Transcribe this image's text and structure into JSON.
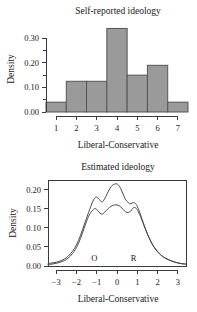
{
  "figure": {
    "width": 197,
    "height": 312,
    "background": "#ffffff",
    "foreground": "#1a1a1a"
  },
  "chart_data": [
    {
      "id": "self-reported-ideology",
      "type": "bar",
      "title": "Self-reported ideology",
      "xlabel": "Liberal-Conservative",
      "ylabel": "Density",
      "categories": [
        "1",
        "2",
        "3",
        "4",
        "5",
        "6",
        "7"
      ],
      "values": [
        0.04,
        0.125,
        0.125,
        0.34,
        0.15,
        0.19,
        0.04
      ],
      "xlim": [
        0.5,
        7.5
      ],
      "ylim": [
        0.0,
        0.35
      ],
      "xticks": [
        1,
        2,
        3,
        4,
        5,
        6,
        7
      ],
      "xtick_labels": [
        "1",
        "2",
        "3",
        "4",
        "5",
        "6",
        "7"
      ],
      "yticks": [
        0.0,
        0.1,
        0.2,
        0.3
      ],
      "ytick_labels": [
        "0.00",
        "0.10",
        "0.20",
        "0.30"
      ],
      "yminor_ticks": [
        0.05,
        0.15,
        0.25
      ],
      "grid": false,
      "legend": false,
      "bar_fill": "#9a9a9a",
      "bar_stroke": "#555555",
      "frame": "l-shaped-axes"
    },
    {
      "id": "estimated-ideology",
      "type": "line",
      "title": "Estimated ideology",
      "xlabel": "Liberal-Conservative",
      "ylabel": "Density",
      "xlim": [
        -3.4,
        3.4
      ],
      "ylim": [
        0.0,
        0.225
      ],
      "xticks": [
        -3,
        -2,
        -1,
        0,
        1,
        2,
        3
      ],
      "xtick_labels": [
        "−3",
        "−2",
        "−1",
        "0",
        "1",
        "2",
        "3"
      ],
      "yticks": [
        0.0,
        0.05,
        0.1,
        0.15,
        0.2
      ],
      "ytick_labels": [
        "0.00",
        "0.05",
        "0.10",
        "0.15",
        "0.20"
      ],
      "grid": false,
      "legend": false,
      "frame": "box",
      "curve_stroke": "#4a4a4a",
      "annotations": [
        {
          "label": "O",
          "x": -1.12,
          "y": 0.012
        },
        {
          "label": "R",
          "x": 0.82,
          "y": 0.012
        }
      ],
      "x": [
        -3.4,
        -3.2,
        -3.0,
        -2.8,
        -2.6,
        -2.4,
        -2.2,
        -2.0,
        -1.8,
        -1.6,
        -1.4,
        -1.2,
        -1.05,
        -0.9,
        -0.78,
        -0.68,
        -0.55,
        -0.42,
        -0.3,
        -0.18,
        -0.05,
        0.05,
        0.18,
        0.3,
        0.42,
        0.55,
        0.68,
        0.8,
        0.92,
        1.05,
        1.2,
        1.4,
        1.6,
        1.8,
        2.0,
        2.2,
        2.4,
        2.6,
        2.8,
        3.0,
        3.2,
        3.4
      ],
      "series": [
        {
          "name": "upper",
          "values": [
            0.006,
            0.008,
            0.01,
            0.013,
            0.018,
            0.026,
            0.038,
            0.055,
            0.08,
            0.11,
            0.14,
            0.168,
            0.18,
            0.176,
            0.168,
            0.17,
            0.182,
            0.196,
            0.207,
            0.213,
            0.215,
            0.213,
            0.203,
            0.188,
            0.174,
            0.166,
            0.163,
            0.166,
            0.163,
            0.15,
            0.128,
            0.098,
            0.072,
            0.052,
            0.038,
            0.027,
            0.02,
            0.015,
            0.011,
            0.008,
            0.006,
            0.005
          ]
        },
        {
          "name": "lower",
          "values": [
            0.004,
            0.005,
            0.007,
            0.01,
            0.014,
            0.021,
            0.032,
            0.048,
            0.072,
            0.102,
            0.13,
            0.146,
            0.15,
            0.142,
            0.136,
            0.137,
            0.144,
            0.151,
            0.156,
            0.159,
            0.16,
            0.159,
            0.155,
            0.148,
            0.142,
            0.14,
            0.144,
            0.152,
            0.152,
            0.142,
            0.124,
            0.096,
            0.071,
            0.051,
            0.037,
            0.027,
            0.02,
            0.015,
            0.011,
            0.008,
            0.006,
            0.005
          ]
        }
      ]
    }
  ]
}
